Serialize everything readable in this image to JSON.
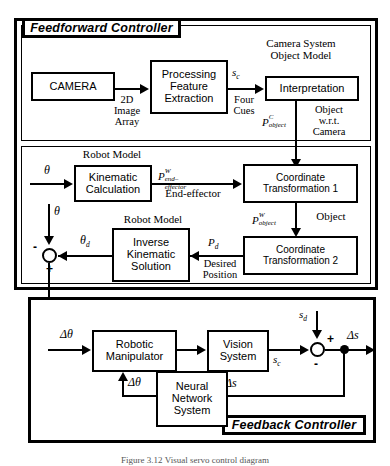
{
  "figure": {
    "caption": "Figure 3.12 Visual servo control diagram"
  },
  "sections": {
    "feedforward": {
      "tag": "Feedforward Controller"
    },
    "feedback": {
      "tag": "Feedback Controller"
    }
  },
  "subsystem_titles": {
    "camera_system_object_model": "Camera System\nObject Model",
    "robot_model_1": "Robot Model",
    "robot_model_2": "Robot Model"
  },
  "blocks": {
    "camera": "CAMERA",
    "processing_feature_extraction": "Processing\nFeature\nExtraction",
    "interpretation": "Interpretation",
    "kinematic_calculation": "Kinematic\nCalculation",
    "coordinate_transformation_1": "Coordinate\nTransformation 1",
    "inverse_kinematic_solution": "Inverse\nKinematic\nSolution",
    "coordinate_transformation_2": "Coordinate\nTransformation 2",
    "robotic_manipulator": "Robotic\nManipulator",
    "vision_system": "Vision\nSystem",
    "neural_network_system": "Neural\nNetwork\nSystem"
  },
  "signals": {
    "image_array": "2D\nImage\nArray",
    "four_cues": "Four\nCues",
    "s_c_top": "s",
    "s_c_top_sub": "c",
    "p_object_camera_base": "P",
    "p_object_camera_sup": "C",
    "p_object_camera_sub": "object",
    "object_wrt_camera": "Object\nw.r.t.\nCamera",
    "theta_in": "θ",
    "theta_fb": "θ",
    "theta_d_base": "θ",
    "theta_d_sub": "d",
    "p_end_effector_base": "P",
    "p_end_effector_sup": "W",
    "p_end_effector_sub": "end–effector",
    "end_effector": "End-effector",
    "p_object_world_base": "P",
    "p_object_world_sup": "W",
    "p_object_world_sub": "object",
    "object": "Object",
    "p_d_base": "P",
    "p_d_sub": "d",
    "desired_position": "Desired\nPosition",
    "delta_theta_in": "Δθ",
    "delta_theta_nn": "Δθ",
    "s_d_base": "s",
    "s_d_sub": "d",
    "s_c_base": "s",
    "s_c_sub": "c",
    "delta_s_out": "Δs",
    "delta_s_fb": "Δs",
    "plus_sign_1": "+",
    "minus_sign_1": "-",
    "plus_sign_2": "+",
    "minus_sign_2": "-"
  }
}
